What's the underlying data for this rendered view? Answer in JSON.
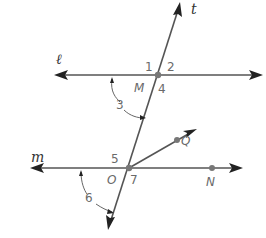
{
  "diagram": {
    "lines": {
      "l": {
        "label": "ℓ"
      },
      "m": {
        "label": "m"
      },
      "t": {
        "label": "t"
      }
    },
    "points": {
      "M": {
        "label": "M"
      },
      "O": {
        "label": "O"
      },
      "Q": {
        "label": "Q"
      },
      "N": {
        "label": "N"
      }
    },
    "angles": {
      "a1": "1",
      "a2": "2",
      "a3": "3",
      "a4": "4",
      "a5": "5",
      "a6": "6",
      "a7": "7"
    },
    "colors": {
      "line": "#555555",
      "arrowhead": "#222222",
      "point": "#777777",
      "label": "#6a6a6a"
    }
  }
}
